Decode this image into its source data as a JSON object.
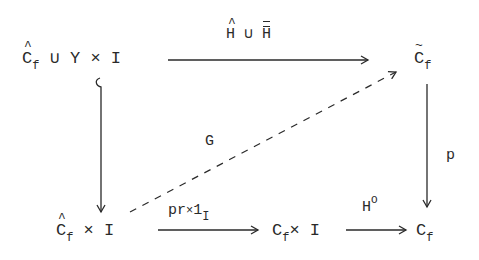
{
  "diagram": {
    "type": "commutative-diagram",
    "nodes": {
      "top_left": {
        "base": "C",
        "accent": "hat",
        "sub": "f",
        "rest": " ∪ Y × I"
      },
      "top_right": {
        "base": "C",
        "accent": "tilde",
        "sub": "f"
      },
      "bottom_left": {
        "base": "C",
        "accent": "hat",
        "sub": "f",
        "rest": " × I"
      },
      "bottom_mid": {
        "base": "C",
        "sub": "f",
        "rest": "× I"
      },
      "bottom_right": {
        "base": "C",
        "sub": "f"
      }
    },
    "arrows": {
      "top": {
        "label_left": "H",
        "label_union": " ∪ ",
        "label_right": "H",
        "from": "top_left",
        "to": "top_right"
      },
      "left": {
        "style": "inclusion",
        "from": "top_left",
        "to": "bottom_left"
      },
      "right": {
        "label": "p",
        "from": "top_right",
        "to": "bottom_right"
      },
      "diagonal": {
        "label": "G",
        "style": "dashed",
        "from": "bottom_left",
        "to": "top_right"
      },
      "bottom1": {
        "label_main": "pr",
        "label_x": "×",
        "label_one": "1",
        "label_sub": "I",
        "from": "bottom_left",
        "to": "bottom_mid"
      },
      "bottom2": {
        "label": "H",
        "label_sup": "O",
        "from": "bottom_mid",
        "to": "bottom_right"
      }
    }
  }
}
